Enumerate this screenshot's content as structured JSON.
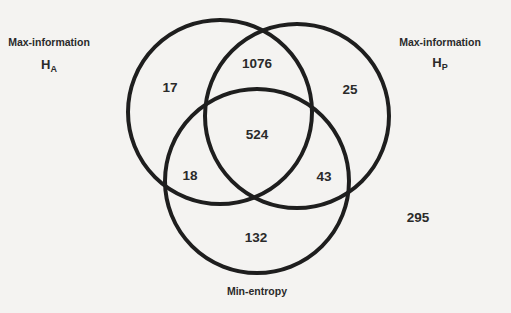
{
  "diagram": {
    "type": "venn3",
    "stroke_color": "#1e1e1e",
    "background": "#f4f3f1",
    "sets": [
      {
        "id": "A",
        "label": "Max-information",
        "symbol": "H",
        "subscript": "A",
        "cx": 220,
        "cy": 112,
        "r": 92,
        "label_x": 49,
        "label_y": 42,
        "sym_x": 49,
        "sym_y": 66
      },
      {
        "id": "P",
        "label": "Max-information",
        "symbol": "H",
        "subscript": "P",
        "cx": 297,
        "cy": 116,
        "r": 92,
        "label_x": 440,
        "label_y": 42,
        "sym_x": 440,
        "sym_y": 64
      },
      {
        "id": "M",
        "label": "Min-entropy",
        "symbol": "",
        "subscript": "",
        "cx": 257,
        "cy": 181,
        "r": 92,
        "label_x": 257,
        "label_y": 291
      }
    ],
    "regions": [
      {
        "id": "A_only",
        "value": "17",
        "x": 170,
        "y": 88
      },
      {
        "id": "A_P",
        "value": "1076",
        "x": 257,
        "y": 64
      },
      {
        "id": "P_only",
        "value": "25",
        "x": 350,
        "y": 90
      },
      {
        "id": "A_P_M",
        "value": "524",
        "x": 257,
        "y": 135
      },
      {
        "id": "A_M",
        "value": "18",
        "x": 190,
        "y": 176
      },
      {
        "id": "P_M",
        "value": "43",
        "x": 324,
        "y": 177
      },
      {
        "id": "M_only",
        "value": "132",
        "x": 256,
        "y": 238
      },
      {
        "id": "none",
        "value": "295",
        "x": 418,
        "y": 218
      }
    ]
  }
}
